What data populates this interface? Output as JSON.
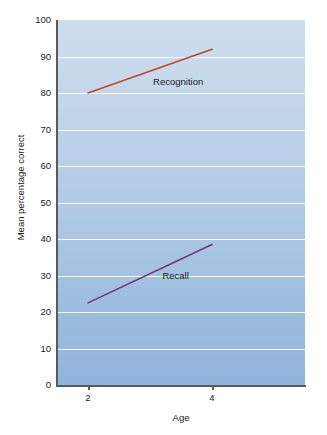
{
  "chart_data": {
    "type": "line",
    "title": "",
    "xlabel": "Age",
    "ylabel": "Mean percentage correct",
    "x": [
      2,
      4
    ],
    "xlim": [
      1.5,
      5.5
    ],
    "ylim": [
      0,
      100
    ],
    "xticks": [
      "2",
      "4"
    ],
    "yticks": [
      "0",
      "10",
      "20",
      "30",
      "40",
      "50",
      "60",
      "70",
      "80",
      "90",
      "100"
    ],
    "grid": true,
    "legend_position": "inline-annotations",
    "series": [
      {
        "name": "Recognition",
        "values": [
          80,
          92
        ],
        "color": "#c0462e"
      },
      {
        "name": "Recall",
        "values": [
          22.5,
          38.5
        ],
        "color": "#6b3a7a"
      }
    ],
    "annotations": [
      {
        "text": "Recognition",
        "x": 3.05,
        "y": 83
      },
      {
        "text": "Recall",
        "x": 3.2,
        "y": 30
      }
    ],
    "background": {
      "gradient_top": "#cfdeee",
      "gradient_bottom": "#90b5da",
      "gridline_color": "#ffffff",
      "axis_color": "#5a5a5a"
    }
  }
}
